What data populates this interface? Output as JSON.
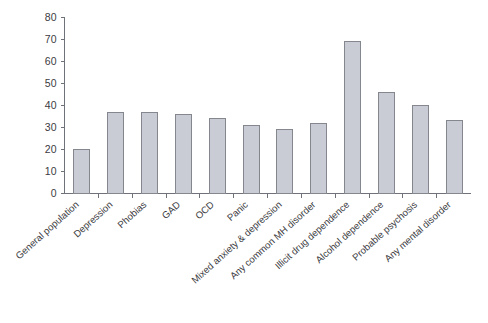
{
  "chart_data": {
    "type": "bar",
    "title": "",
    "subtitle": "",
    "xlabel": "",
    "ylabel": "",
    "ylim": [
      0,
      80
    ],
    "ytick_step": 10,
    "yticks": [
      "0",
      "10",
      "20",
      "30",
      "40",
      "50",
      "60",
      "70",
      "80"
    ],
    "grid": false,
    "legend": false,
    "legend_position": "none",
    "categories": [
      "General population",
      "Depression",
      "Phobias",
      "GAD",
      "OCD",
      "Panic",
      "Mixed anxiety & depression",
      "Any common MH disorder",
      "Illicit drug dependence",
      "Alcohol dependence",
      "Probable psychosis",
      "Any mental disorder"
    ],
    "values": [
      20,
      37,
      37,
      36,
      34,
      31,
      29,
      32,
      69,
      46,
      40,
      33
    ],
    "bar_fill": "#c9ccd4",
    "bar_stroke": "#85878e",
    "axis_color": "#6f7278",
    "text_color": "#3b3b41",
    "label_rotation_deg": -42
  }
}
